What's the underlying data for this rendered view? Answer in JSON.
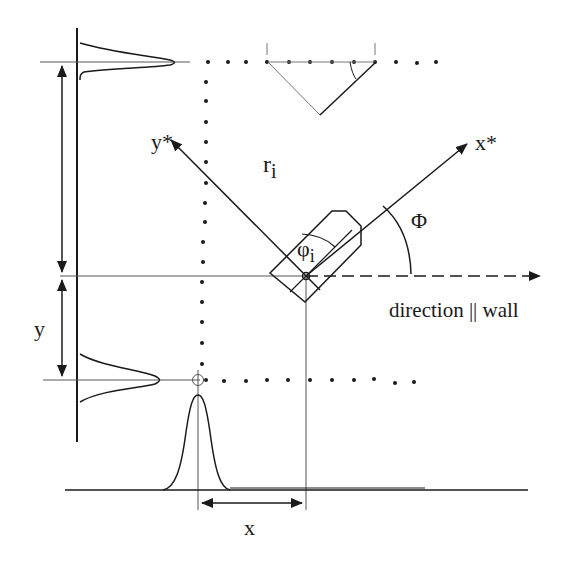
{
  "labels": {
    "x_star": "x*",
    "y_star": "y*",
    "r": "r",
    "r_sub": "i",
    "phi_small": "φ",
    "phi_small_sub": "i",
    "phi_big": "Φ",
    "direction": "direction || wall",
    "y": "y",
    "x": "x"
  },
  "colors": {
    "ink": "#1a1a1a",
    "thin": "#555555",
    "background": "#ffffff"
  }
}
